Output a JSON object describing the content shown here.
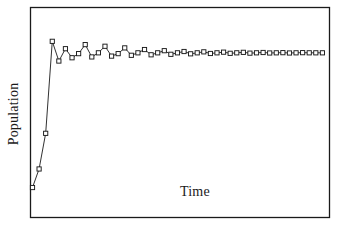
{
  "chart_data": {
    "type": "line",
    "title": "",
    "xlabel": "Time",
    "ylabel": "Population",
    "grid": false,
    "legend": null,
    "axis_ticks": false,
    "axis_tick_labels": false,
    "frame": "box",
    "marker": "open-square",
    "line_color": "#1a1a1a",
    "marker_fill": "#ffffff",
    "marker_edge": "#1a1a1a",
    "background": "#ffffff",
    "xlim": [
      0,
      45
    ],
    "ylim": [
      0,
      1.12
    ],
    "carrying_capacity": 0.905,
    "x": [
      0,
      1,
      2,
      3,
      4,
      5,
      6,
      7,
      8,
      9,
      10,
      11,
      12,
      13,
      14,
      15,
      16,
      17,
      18,
      19,
      20,
      21,
      22,
      23,
      24,
      25,
      26,
      27,
      28,
      29,
      30,
      31,
      32,
      33,
      34,
      35,
      36,
      37,
      38,
      39,
      40,
      41,
      42,
      43,
      44
    ],
    "y": [
      0.085,
      0.198,
      0.415,
      0.975,
      0.855,
      0.93,
      0.875,
      0.9,
      0.955,
      0.88,
      0.905,
      0.945,
      0.885,
      0.9,
      0.935,
      0.89,
      0.905,
      0.925,
      0.893,
      0.905,
      0.918,
      0.896,
      0.905,
      0.913,
      0.899,
      0.905,
      0.911,
      0.901,
      0.905,
      0.909,
      0.902,
      0.905,
      0.908,
      0.903,
      0.905,
      0.907,
      0.904,
      0.905,
      0.906,
      0.904,
      0.905,
      0.906,
      0.905,
      0.905,
      0.905
    ]
  }
}
